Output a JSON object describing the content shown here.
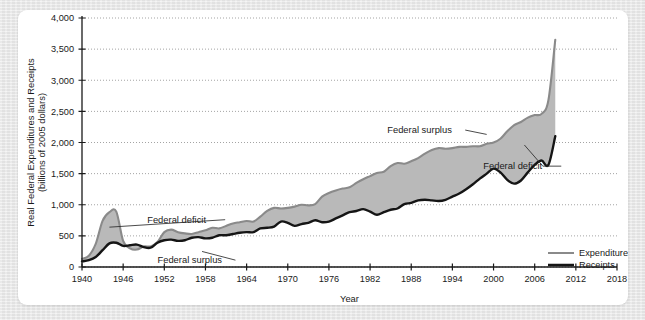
{
  "figure": {
    "background_color": "#e8e8e8",
    "card_color": "#ffffff"
  },
  "chart_data": {
    "type": "area",
    "title": "",
    "subtitle": "",
    "xlabel": "Year",
    "ylabel": "Real Federal Expenditures and Receipts (billions of 2005 dollars)",
    "ylabel_line1": "Real Federal Expenditures and Receipts",
    "ylabel_line2": "(billions of 2005 dollars)",
    "xlim": [
      1940,
      2018
    ],
    "ylim": [
      0,
      4000
    ],
    "grid": true,
    "grid_style": "dotted-horizontal",
    "xticks": [
      1940,
      1946,
      1952,
      1958,
      1964,
      1970,
      1976,
      1982,
      1988,
      1994,
      2000,
      2006,
      2012,
      2018
    ],
    "xtick_labels": [
      "1940",
      "1946",
      "1952",
      "1958",
      "1964",
      "1970",
      "1976",
      "1982",
      "1988",
      "1994",
      "2000",
      "2006",
      "2012",
      "2018"
    ],
    "yticks": [
      0,
      500,
      1000,
      1500,
      2000,
      2500,
      3000,
      3500,
      4000
    ],
    "ytick_labels": [
      "0",
      "500",
      "1,000",
      "1,500",
      "2,000",
      "2,500",
      "3,000",
      "3,500",
      "4,000"
    ],
    "legend_position": "bottom-right",
    "colors": {
      "expenditures_line": "#8a8a8a",
      "receipts_line": "#151515",
      "fill": "#b9b9b9",
      "axis": "#1a1a1a",
      "grid": "#9a9a9a"
    },
    "x": [
      1940,
      1941,
      1942,
      1943,
      1944,
      1945,
      1946,
      1947,
      1948,
      1949,
      1950,
      1951,
      1952,
      1953,
      1954,
      1955,
      1956,
      1957,
      1958,
      1959,
      1960,
      1961,
      1962,
      1963,
      1964,
      1965,
      1966,
      1967,
      1968,
      1969,
      1970,
      1971,
      1972,
      1973,
      1974,
      1975,
      1976,
      1977,
      1978,
      1979,
      1980,
      1981,
      1982,
      1983,
      1984,
      1985,
      1986,
      1987,
      1988,
      1989,
      1990,
      1991,
      1992,
      1993,
      1994,
      1995,
      1996,
      1997,
      1998,
      1999,
      2000,
      2001,
      2002,
      2003,
      2004,
      2005,
      2006,
      2007,
      2008,
      2009
    ],
    "series": [
      {
        "name": "Expenditures",
        "color": "#8a8a8a",
        "values": [
          130,
          180,
          370,
          740,
          880,
          890,
          420,
          300,
          280,
          330,
          330,
          400,
          560,
          600,
          560,
          540,
          530,
          560,
          590,
          630,
          620,
          660,
          700,
          720,
          740,
          730,
          810,
          900,
          950,
          940,
          950,
          970,
          1000,
          990,
          1010,
          1130,
          1190,
          1230,
          1260,
          1280,
          1350,
          1410,
          1460,
          1510,
          1530,
          1620,
          1670,
          1660,
          1700,
          1750,
          1820,
          1880,
          1910,
          1900,
          1910,
          1930,
          1930,
          1940,
          1940,
          1980,
          2000,
          2060,
          2180,
          2280,
          2330,
          2400,
          2440,
          2460,
          2680,
          3650
        ]
      },
      {
        "name": "Receipts",
        "color": "#151515",
        "values": [
          90,
          110,
          160,
          270,
          380,
          390,
          340,
          350,
          360,
          320,
          310,
          390,
          430,
          440,
          420,
          430,
          470,
          480,
          460,
          470,
          510,
          510,
          530,
          550,
          560,
          560,
          620,
          630,
          650,
          730,
          710,
          660,
          690,
          710,
          750,
          720,
          730,
          780,
          830,
          880,
          900,
          930,
          890,
          840,
          880,
          920,
          940,
          1010,
          1030,
          1070,
          1080,
          1070,
          1060,
          1080,
          1130,
          1180,
          1250,
          1330,
          1420,
          1500,
          1580,
          1520,
          1400,
          1340,
          1390,
          1520,
          1640,
          1710,
          1640,
          2100
        ]
      }
    ],
    "annotations": [
      {
        "text": "Federal deficit",
        "x_data": 1949.5,
        "y_data": 760,
        "anchor_x": 1944.0,
        "anchor_y": 640,
        "align": "left"
      },
      {
        "text": "Federal surplus",
        "x_data": 1951.0,
        "y_data": 110,
        "anchor_x": 1957.5,
        "anchor_y": 250,
        "align": "left"
      },
      {
        "text": "Federal surplus",
        "x_data": 1984.5,
        "y_data": 2200,
        "anchor_x": 1999.0,
        "anchor_y": 2130,
        "align": "left"
      },
      {
        "text": "Federal deficit",
        "x_data": 1998.5,
        "y_data": 1620,
        "anchor_x": 2004.5,
        "anchor_y": 1960,
        "align": "left"
      }
    ],
    "legend": [
      {
        "label": "Expenditures",
        "color": "#8a8a8a",
        "thickness": 2.2
      },
      {
        "label": "Receipts",
        "color": "#151515",
        "thickness": 2.6
      }
    ]
  }
}
